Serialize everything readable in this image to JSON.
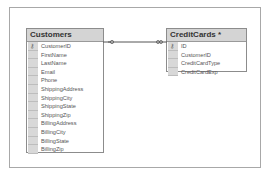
{
  "diagram": {
    "tables": [
      {
        "name": "Customers",
        "columns": [
          {
            "name": "CustomerID",
            "primary_key": true
          },
          {
            "name": "FirstName",
            "primary_key": false
          },
          {
            "name": "LastName",
            "primary_key": false
          },
          {
            "name": "Email",
            "primary_key": false
          },
          {
            "name": "Phone",
            "primary_key": false
          },
          {
            "name": "ShippingAddress",
            "primary_key": false
          },
          {
            "name": "ShippingCity",
            "primary_key": false
          },
          {
            "name": "ShippingState",
            "primary_key": false
          },
          {
            "name": "ShippingZip",
            "primary_key": false
          },
          {
            "name": "BillingAddress",
            "primary_key": false
          },
          {
            "name": "BillingCity",
            "primary_key": false
          },
          {
            "name": "BillingState",
            "primary_key": false
          },
          {
            "name": "BillingZip",
            "primary_key": false
          }
        ]
      },
      {
        "name": "CreditCards *",
        "columns": [
          {
            "name": "ID",
            "primary_key": true
          },
          {
            "name": "CustomerID",
            "primary_key": false
          },
          {
            "name": "CreditCardType",
            "primary_key": false
          },
          {
            "name": "CreditCardExp",
            "primary_key": false
          }
        ]
      }
    ],
    "relationship": {
      "from": "Customers",
      "to": "CreditCards",
      "type": "one-to-many"
    },
    "key_icon": "key-icon"
  }
}
